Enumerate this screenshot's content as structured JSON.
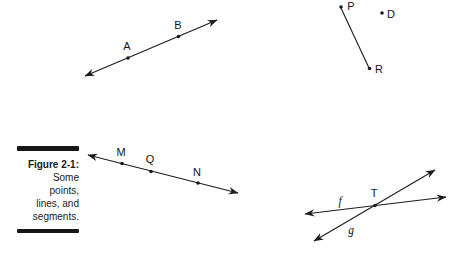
{
  "figure": {
    "caption": {
      "title": "Figure 2-1:",
      "lines": [
        "Some",
        "points,",
        "lines, and",
        "segments."
      ]
    },
    "colors": {
      "ink": "#1c1c1c",
      "background": "#ffffff"
    },
    "diagram": {
      "lines": [
        {
          "name": "line-AB",
          "x1": 85,
          "y1": 76,
          "x2": 217,
          "y2": 20,
          "arrow_start": true,
          "arrow_end": true,
          "label": "",
          "label_x": 0,
          "label_y": 0,
          "italic": false
        },
        {
          "name": "segment-PR",
          "x1": 341,
          "y1": 8,
          "x2": 369,
          "y2": 68,
          "arrow_start": false,
          "arrow_end": false,
          "label": "",
          "label_x": 0,
          "label_y": 0,
          "italic": false
        },
        {
          "name": "line-MQN",
          "x1": 88,
          "y1": 155,
          "x2": 238,
          "y2": 193,
          "arrow_start": true,
          "arrow_end": true,
          "label": "",
          "label_x": 0,
          "label_y": 0,
          "italic": false
        },
        {
          "name": "line-f",
          "x1": 305,
          "y1": 214,
          "x2": 446,
          "y2": 197,
          "arrow_start": true,
          "arrow_end": true,
          "label": "f",
          "label_x": 340,
          "label_y": 205,
          "italic": true
        },
        {
          "name": "line-g",
          "x1": 314,
          "y1": 241,
          "x2": 435,
          "y2": 170,
          "arrow_start": true,
          "arrow_end": true,
          "label": "g",
          "label_x": 351,
          "label_y": 234,
          "italic": true
        }
      ],
      "points": [
        {
          "label": "A",
          "x": 128,
          "y": 58,
          "label_x": 127,
          "label_y": 50
        },
        {
          "label": "B",
          "x": 178.5,
          "y": 36.5,
          "label_x": 178,
          "label_y": 29
        },
        {
          "label": "P",
          "x": 341,
          "y": 7,
          "label_x": 351,
          "label_y": 10
        },
        {
          "label": "D",
          "x": 382,
          "y": 13,
          "label_x": 391,
          "label_y": 18
        },
        {
          "label": "R",
          "x": 369.5,
          "y": 68.5,
          "label_x": 379,
          "label_y": 73
        },
        {
          "label": "M",
          "x": 122,
          "y": 163.5,
          "label_x": 121,
          "label_y": 156
        },
        {
          "label": "Q",
          "x": 151,
          "y": 171.5,
          "label_x": 150,
          "label_y": 163
        },
        {
          "label": "N",
          "x": 198,
          "y": 183,
          "label_x": 197,
          "label_y": 176
        },
        {
          "label": "T",
          "x": 375,
          "y": 205.5,
          "label_x": 374,
          "label_y": 197
        }
      ]
    }
  }
}
